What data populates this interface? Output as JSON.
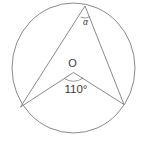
{
  "figure": {
    "type": "geometry-diagram",
    "stroke_color": "#8a8a8a",
    "text_color": "#3a3a3a",
    "background_color": "#ffffff"
  },
  "labels": {
    "center_point": "O",
    "central_angle": "110°",
    "inscribed_angle": "α"
  },
  "geometry": {
    "circle": {
      "center_x": 73.5,
      "center_y": 68,
      "radius": 62
    },
    "points": {
      "apex": {
        "x": 85,
        "y": 6,
        "name": "inscribed-angle-vertex"
      },
      "left": {
        "x": 20.5,
        "y": 107,
        "name": "left-chord-endpoint"
      },
      "right": {
        "x": 124,
        "y": 104.5,
        "name": "right-chord-endpoint"
      },
      "center": {
        "x": 73.5,
        "y": 68,
        "name": "circle-center"
      }
    },
    "segments": [
      {
        "from": "apex",
        "to": "left",
        "name": "chord-apex-left"
      },
      {
        "from": "apex",
        "to": "right",
        "name": "chord-apex-right"
      },
      {
        "from": "center",
        "to": "left",
        "name": "radius-center-left"
      },
      {
        "from": "center",
        "to": "right",
        "name": "radius-center-right"
      }
    ],
    "angle_marks": [
      {
        "at": "apex",
        "name": "inscribed-angle-arc"
      },
      {
        "at": "center",
        "name": "central-angle-arc"
      }
    ]
  }
}
